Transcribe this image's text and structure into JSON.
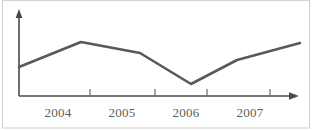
{
  "chart_data": {
    "type": "line",
    "title": "",
    "subtitle": "",
    "xlabel": "",
    "ylabel": "",
    "grid": false,
    "legend": false,
    "legend_position": "none",
    "x_tick_labels": [
      "2004",
      "2005",
      "2006",
      "2007"
    ],
    "x_tick_positions_px": [
      90,
      155,
      207,
      270
    ],
    "x_label_positions_px": [
      58,
      122,
      186,
      250
    ],
    "axis_range_px": {
      "x_axis_y": 96,
      "y_axis_x": 19,
      "x_axis_start": 19,
      "x_axis_end": 298,
      "y_axis_top": 10
    },
    "series": [
      {
        "name": "Series 1",
        "color": "#595959",
        "x": [
          "start",
          "2004.4",
          "2005.1",
          "2006.1",
          "2006.8",
          "end"
        ],
        "values": [
          36,
          62,
          51,
          19,
          43,
          60
        ],
        "points_px": [
          {
            "x": 19,
            "y": 67
          },
          {
            "x": 81,
            "y": 42
          },
          {
            "x": 140,
            "y": 53
          },
          {
            "x": 191,
            "y": 84
          },
          {
            "x": 237,
            "y": 60
          },
          {
            "x": 300,
            "y": 43
          }
        ]
      }
    ],
    "ylim": [
      0,
      100
    ],
    "y_ticks_shown": false,
    "axis_arrows": {
      "x": true,
      "y": true
    }
  },
  "figure": {
    "width": 314,
    "height": 131,
    "background": "#ffffff",
    "border_color": "#d2d2d2",
    "axis_color": "#4a4a4a",
    "label_color": "#5d5d5d",
    "line_color": "#595959"
  },
  "labels": {
    "year_2004": "2004",
    "year_2005": "2005",
    "year_2006": "2006",
    "year_2007": "2007"
  }
}
